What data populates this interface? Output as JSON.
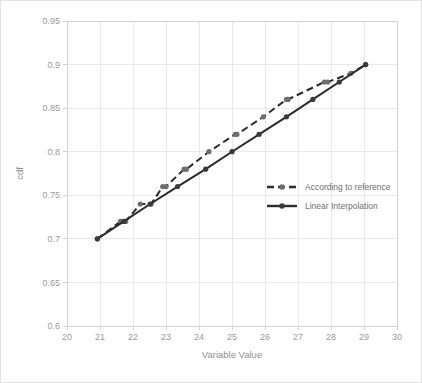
{
  "chart_data": {
    "type": "line",
    "title": "",
    "xlabel": "Variable Value",
    "ylabel": "cdf",
    "xlim": [
      20,
      30
    ],
    "ylim": [
      0.6,
      0.95
    ],
    "xticks": [
      20,
      21,
      22,
      23,
      24,
      25,
      26,
      27,
      28,
      29,
      30
    ],
    "xticklabels": [
      "20",
      "21",
      "22",
      "23",
      "24",
      "25",
      "26",
      "27",
      "28",
      "29",
      "30"
    ],
    "yticks": [
      0.6,
      0.65,
      0.7,
      0.75,
      0.8,
      0.85,
      0.9,
      0.95
    ],
    "yticklabels": [
      "0.6",
      "0.65",
      "0.7",
      "0.75",
      "0.8",
      "0.85",
      "0.9",
      "0.95"
    ],
    "grid": true,
    "legend_position": "center-right",
    "series": [
      {
        "name": "According to reference",
        "style": "dashed",
        "marker": "circle",
        "color": "#2b2b2b",
        "x": [
          20.92,
          21.62,
          21.78,
          22.22,
          22.55,
          22.9,
          23.0,
          23.55,
          23.62,
          24.3,
          25.1,
          25.15,
          25.95,
          26.65,
          26.7,
          27.8,
          27.9,
          28.6,
          29.05
        ],
        "y": [
          0.7,
          0.72,
          0.72,
          0.74,
          0.74,
          0.76,
          0.76,
          0.78,
          0.78,
          0.8,
          0.82,
          0.82,
          0.84,
          0.86,
          0.86,
          0.88,
          0.88,
          0.89,
          0.9
        ]
      },
      {
        "name": "Linear Interpolation",
        "style": "solid",
        "marker": "circle",
        "color": "#2b2b2b",
        "x": [
          20.92,
          21.72,
          22.52,
          23.35,
          24.2,
          25.0,
          25.82,
          26.65,
          27.45,
          28.25,
          29.05
        ],
        "y": [
          0.7,
          0.72,
          0.74,
          0.76,
          0.78,
          0.8,
          0.82,
          0.84,
          0.86,
          0.88,
          0.9
        ]
      }
    ]
  },
  "legend": {
    "items": [
      {
        "label": "According to reference"
      },
      {
        "label": "Linear Interpolation"
      }
    ]
  }
}
